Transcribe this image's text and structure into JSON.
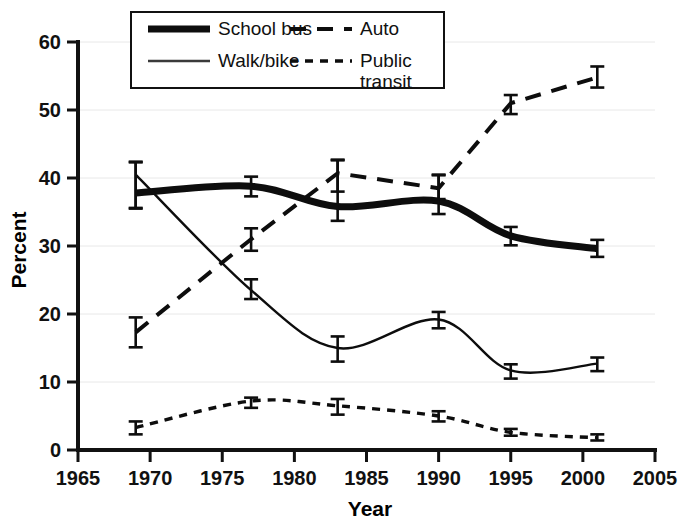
{
  "chart_data": {
    "type": "line",
    "title": "",
    "xlabel": "Year",
    "ylabel": "Percent",
    "xlim": [
      1965,
      2005
    ],
    "ylim": [
      0,
      60
    ],
    "xticks": [
      1965,
      1970,
      1975,
      1980,
      1985,
      1990,
      1995,
      2000,
      2005
    ],
    "yticks": [
      0,
      10,
      20,
      30,
      40,
      50,
      60
    ],
    "grid": true,
    "legend_position": "top-center",
    "x": [
      1969,
      1977,
      1983,
      1990,
      1995,
      2001
    ],
    "series": [
      {
        "name": "School bus",
        "style": "thick-solid",
        "color": "#0d0d0d",
        "width": 7,
        "dash": "",
        "values": [
          37.8,
          38.8,
          35.8,
          36.6,
          31.5,
          29.6
        ],
        "err_low": [
          35.6,
          37.3,
          33.7,
          34.7,
          30.1,
          28.4
        ],
        "err_high": [
          42.3,
          40.2,
          42.6,
          40.4,
          32.8,
          30.9
        ]
      },
      {
        "name": "Auto",
        "style": "long-dash",
        "color": "#0d0d0d",
        "width": 4,
        "dash": "16 11",
        "values": [
          17.3,
          31.0,
          40.7,
          38.5,
          51.0,
          54.8
        ],
        "err_low": [
          15.1,
          29.3,
          38.0,
          36.9,
          49.4,
          53.3
        ],
        "err_high": [
          19.5,
          32.6,
          42.7,
          40.5,
          52.2,
          56.4
        ]
      },
      {
        "name": "Walk/bike",
        "style": "thin-solid",
        "color": "#3a3a3a",
        "width": 2.4,
        "dash": "",
        "values": [
          40.5,
          23.5,
          15.0,
          19.2,
          11.7,
          12.7
        ],
        "err_low": [
          35.5,
          22.2,
          13.0,
          17.9,
          10.5,
          11.6
        ],
        "err_high": [
          42.4,
          25.1,
          16.7,
          20.3,
          12.6,
          13.6
        ]
      },
      {
        "name": "Public transit",
        "style": "short-dash",
        "color": "#0d0d0d",
        "width": 3.4,
        "dash": "8 7",
        "values": [
          3.3,
          7.2,
          6.5,
          5.0,
          2.6,
          1.8
        ],
        "err_low": [
          2.3,
          6.2,
          5.2,
          4.2,
          2.1,
          1.4
        ],
        "err_high": [
          4.2,
          7.7,
          7.5,
          5.7,
          3.1,
          2.3
        ]
      }
    ],
    "legend_entries": [
      {
        "label": "School bus",
        "style": "thick-solid"
      },
      {
        "label": "Auto",
        "style": "long-dash"
      },
      {
        "label": "Walk/bike",
        "style": "thin-solid"
      },
      {
        "label": "Public",
        "label2": "transit",
        "style": "short-dash"
      }
    ]
  }
}
